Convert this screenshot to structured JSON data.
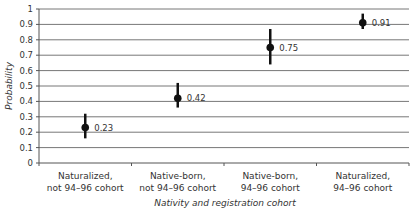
{
  "chart_data": {
    "type": "scatter",
    "subtype": "point-with-error-bars",
    "title": "",
    "xlabel": "Nativity and registration cohort",
    "ylabel": "Probability",
    "ylim": [
      0,
      1
    ],
    "yticks": [
      "0",
      "0.1",
      "0.2",
      "0.3",
      "0.4",
      "0.5",
      "0.6",
      "0.7",
      "0.8",
      "0.9",
      "1"
    ],
    "grid": true,
    "legend": null,
    "categories": [
      [
        "Naturalized,",
        "not 94–96 cohort"
      ],
      [
        "Native-born,",
        "not 94–96 cohort"
      ],
      [
        "Native-born,",
        "94–96 cohort"
      ],
      [
        "Naturalized,",
        "94–96 cohort"
      ]
    ],
    "values": [
      0.23,
      0.42,
      0.75,
      0.91
    ],
    "value_labels": [
      "0.23",
      "0.42",
      "0.75",
      "0.91"
    ],
    "error_low": [
      0.16,
      0.36,
      0.64,
      0.87
    ],
    "error_high": [
      0.32,
      0.52,
      0.87,
      0.97
    ]
  },
  "colors": {
    "point": "#111111",
    "grid": "#777777",
    "axis": "#555555"
  }
}
